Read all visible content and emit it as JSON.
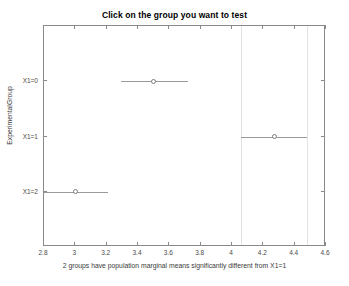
{
  "chart_data": {
    "type": "scatter",
    "title": "Click on the group you want to test",
    "xlabel": "2 groups have population marginal means significantly different from X1=1",
    "ylabel": "ExperimentalGroup",
    "xlim": [
      2.8,
      4.6
    ],
    "xticks": [
      2.8,
      3,
      3.2,
      3.4,
      3.6,
      3.8,
      4,
      4.2,
      4.4,
      4.6
    ],
    "xtick_labels": [
      "2.8",
      "3",
      "3.2",
      "3.4",
      "3.6",
      "3.8",
      "4",
      "4.2",
      "4.4",
      "4.6"
    ],
    "categories": [
      "X1=0",
      "X1=1",
      "X1=2"
    ],
    "grid": false,
    "legend": "none",
    "marker_style": "open-circle",
    "reference_lines": [
      4.06,
      4.48
    ],
    "selected_group": "X1=1",
    "points": [
      {
        "group": "X1=0",
        "mean": 3.5,
        "lower": 3.29,
        "upper": 3.72,
        "clipped_left": false
      },
      {
        "group": "X1=1",
        "mean": 4.27,
        "lower": 4.06,
        "upper": 4.48,
        "clipped_left": false
      },
      {
        "group": "X1=2",
        "mean": 3.0,
        "lower": 2.79,
        "upper": 3.21,
        "clipped_left": true
      }
    ]
  },
  "colors": {
    "axis": "#8a8a8a",
    "series": "#9a9a9a",
    "reference": "#e2e2e2",
    "text": "#3a3a3a",
    "title": "#000000",
    "background": "#ffffff"
  }
}
